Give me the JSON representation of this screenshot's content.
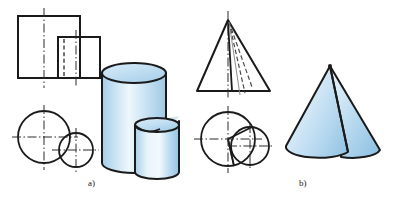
{
  "figure": {
    "background_color": "#ffffff",
    "line_color": "#1a1a1a",
    "solid_fill_light": "#eaf4fb",
    "solid_fill_mid": "#cbe4f4",
    "solid_fill_dark": "#9ec9e6",
    "outline_width": 2,
    "thin_line_width": 1,
    "centerline_color": "#2a2a2a"
  },
  "captions": {
    "part_a": "a)",
    "part_b": "b)"
  },
  "part_a": {
    "label": "a)",
    "description": "Two intersecting cylinders",
    "front_view": {
      "name": "two-overlapping-rectangles",
      "large_rect": {
        "x": 18,
        "y": 16,
        "width": 62,
        "height": 62
      },
      "small_rect": {
        "x": 58,
        "y": 37,
        "width": 42,
        "height": 41
      },
      "centerline_vertical_large_x": 44,
      "centerline_vertical_small_x": 76,
      "hidden_line_x": 58
    },
    "top_view": {
      "name": "two-overlapping-circles",
      "large_circle": {
        "cx": 44,
        "cy": 137,
        "r": 26
      },
      "small_circle": {
        "cx": 76,
        "cy": 150,
        "r": 17
      }
    },
    "pictorial": {
      "name": "intersecting-cylinders",
      "big_cylinder": {
        "cx": 134,
        "top_y": 73,
        "bottom_y": 163,
        "rx": 32,
        "ry": 10
      },
      "small_cylinder": {
        "cx": 157,
        "top_y": 125,
        "bottom_y": 173,
        "rx": 22,
        "ry": 7
      }
    }
  },
  "part_b": {
    "label": "b)",
    "description": "Two intersecting cones",
    "front_view": {
      "name": "cone-triangle-profile",
      "apex": {
        "x": 228,
        "y": 20
      },
      "base_left": {
        "x": 197,
        "y": 91
      },
      "base_right": {
        "x": 270,
        "y": 91
      },
      "axis_x": 228,
      "solid_edge_x": 232,
      "dashed_edges": [
        243,
        250
      ]
    },
    "top_view": {
      "name": "two-overlapping-circles-with-sector",
      "large_circle": {
        "cx": 228,
        "cy": 139,
        "r": 27
      },
      "small_circle": {
        "cx": 250,
        "cy": 146,
        "r": 19
      }
    },
    "pictorial": {
      "name": "intersecting-cones",
      "apex": {
        "x": 330,
        "y": 65
      },
      "left_cone_base": {
        "cx": 318,
        "cy": 148,
        "rx": 33,
        "ry": 11
      },
      "right_cone_base": {
        "cx": 352,
        "cy": 155,
        "rx": 28,
        "ry": 10
      }
    }
  }
}
